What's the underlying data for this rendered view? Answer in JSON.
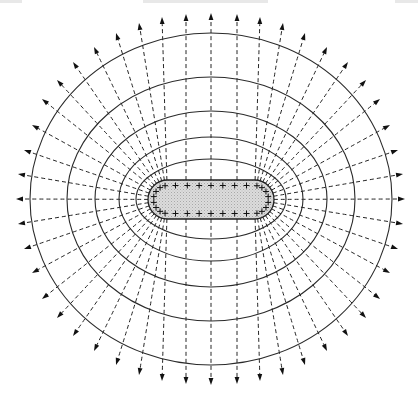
{
  "figure": {
    "center": [
      211,
      199
    ],
    "header_hints": [
      {
        "x": 0,
        "w": 22
      },
      {
        "x": 143,
        "w": 125
      },
      {
        "x": 395,
        "w": 23
      }
    ],
    "conductor": {
      "shape": "stadium",
      "x1": 148,
      "x2": 274,
      "y1": 180,
      "y2": 219,
      "fill": "#d4d4d4",
      "charge_symbol": "+",
      "charge_count": 34
    },
    "equipotentials": [
      {
        "rx": 75,
        "ry": 40
      },
      {
        "rx": 92,
        "ry": 62
      },
      {
        "rx": 116,
        "ry": 88
      },
      {
        "rx": 144,
        "ry": 122
      },
      {
        "rx": 181,
        "ry": 166
      }
    ],
    "field_lines": {
      "style": "dashed",
      "arrow_tips_top": [
        [
          42,
          99
        ],
        [
          57,
          80
        ],
        [
          73,
          62
        ],
        [
          94,
          47
        ],
        [
          116,
          33
        ],
        [
          139,
          23
        ],
        [
          162,
          17
        ],
        [
          186,
          14
        ],
        [
          211,
          13
        ],
        [
          237,
          14
        ],
        [
          260,
          17
        ],
        [
          283,
          23
        ],
        [
          305,
          33
        ],
        [
          327,
          47
        ],
        [
          348,
          62
        ],
        [
          366,
          80
        ],
        [
          380,
          99
        ]
      ],
      "arrow_tips_left": [
        [
          42,
          101
        ],
        [
          32,
          125
        ],
        [
          24,
          150
        ],
        [
          18,
          174
        ],
        [
          16,
          199
        ],
        [
          18,
          224
        ],
        [
          24,
          249
        ],
        [
          32,
          273
        ],
        [
          42,
          297
        ]
      ],
      "arrow_tips_right": [
        [
          380,
          101
        ],
        [
          390,
          125
        ],
        [
          398,
          150
        ],
        [
          403,
          174
        ],
        [
          405,
          199
        ],
        [
          403,
          224
        ],
        [
          398,
          249
        ],
        [
          390,
          273
        ],
        [
          380,
          297
        ]
      ]
    },
    "colors": {
      "line": "#222222",
      "background": "#ffffff",
      "conductor_fill": "#d4d4d4"
    }
  }
}
